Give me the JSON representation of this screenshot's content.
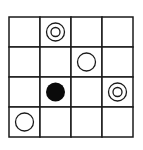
{
  "board": {
    "rows": 4,
    "cols": 4,
    "line_color": "#1a1a1a",
    "background": "#ffffff",
    "pieces": [
      {
        "row": 0,
        "col": 1,
        "type": "double-ring",
        "icon": "double-circle-icon"
      },
      {
        "row": 1,
        "col": 2,
        "type": "ring",
        "icon": "hollow-circle-icon"
      },
      {
        "row": 2,
        "col": 1,
        "type": "filled",
        "icon": "filled-circle-icon"
      },
      {
        "row": 2,
        "col": 3,
        "type": "double-ring",
        "icon": "double-circle-icon"
      },
      {
        "row": 3,
        "col": 0,
        "type": "ring",
        "icon": "hollow-circle-icon"
      }
    ]
  }
}
